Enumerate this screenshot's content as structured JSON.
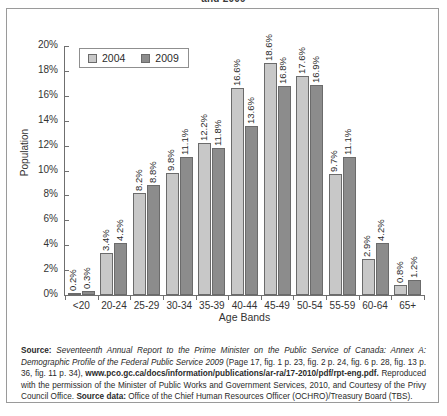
{
  "title_clipped": "and 2009",
  "legend": {
    "position": "top-left-inside",
    "items": [
      {
        "label": "2004",
        "color": "#c8c8c8"
      },
      {
        "label": "2009",
        "color": "#8c8c8c"
      }
    ]
  },
  "axes": {
    "xlabel": "Age Bands",
    "ylabel": "Population",
    "yticks": [
      "0%",
      "2%",
      "4%",
      "6%",
      "8%",
      "10%",
      "12%",
      "14%",
      "16%",
      "18%",
      "20%"
    ]
  },
  "source_note": {
    "source_label": "Source:",
    "title_italic": "Seventeenth Annual Report to the Prime Minister on the Public Service of Canada: Annex A: Demographic Profile of the Federal Public Service 2009",
    "pages": "(Page 17, fig. 1 p. 23, fig. 2 p. 24, fig. 6 p. 28, fig. 13 p. 36, fig. 11 p. 34),",
    "url": "www.pco.gc.ca/docs/information/publications/ar-ra/17-2010/pdf/rpt-eng.pdf.",
    "permission": "Reproduced with the permission of the Minister of Public Works and Government Services, 2010, and Courtesy of the Privy Council Office.",
    "source_data_label": "Source data:",
    "source_data_text": "Office of the Chief Human Resources Officer (OCHRO)/Treasury Board (TBS)."
  },
  "chart_data": {
    "type": "bar",
    "title": "and 2009",
    "xlabel": "Age Bands",
    "ylabel": "Population",
    "ylim": [
      0,
      20
    ],
    "ytick_step": 2,
    "grid": false,
    "legend_position": "upper left",
    "units": "percent",
    "categories": [
      "<20",
      "20-24",
      "25-29",
      "30-34",
      "35-39",
      "40-44",
      "45-49",
      "50-54",
      "55-59",
      "60-64",
      "65+"
    ],
    "series": [
      {
        "name": "2004",
        "color": "#c8c8c8",
        "values": [
          0.2,
          3.4,
          8.2,
          9.8,
          12.2,
          16.6,
          18.6,
          17.6,
          9.7,
          2.9,
          0.8
        ],
        "labels": [
          "0.2%",
          "3.4%",
          "8.2%",
          "9.8%",
          "12.2%",
          "16.6%",
          "18.6%",
          "17.6%",
          "9.7%",
          "2.9%",
          "0.8%"
        ]
      },
      {
        "name": "2009",
        "color": "#8c8c8c",
        "values": [
          0.3,
          4.2,
          8.8,
          11.1,
          11.8,
          13.6,
          16.8,
          16.9,
          11.1,
          4.2,
          1.2
        ],
        "labels": [
          "0.3%",
          "4.2%",
          "8.8%",
          "11.1%",
          "11.8%",
          "13.6%",
          "16.8%",
          "16.9%",
          "11.1%",
          "4.2%",
          "1.2%"
        ]
      }
    ]
  }
}
